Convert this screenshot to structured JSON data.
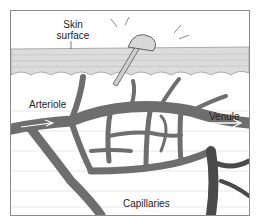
{
  "diagram": {
    "labels": {
      "skin_surface_line1": "Skin",
      "skin_surface_line2": "surface",
      "arteriole": "Arteriole",
      "venule": "Venule",
      "capillaries": "Capillaries"
    },
    "colors": {
      "frame": "#8a8a8a",
      "skin": "#d9d9d9",
      "vessel": "#6e6e6e",
      "vessel_dark": "#4a4a4a",
      "tissue": "#f3f3f3"
    }
  }
}
